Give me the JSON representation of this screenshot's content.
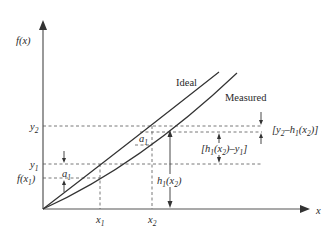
{
  "diagram": {
    "y_axis_label": "f(x)",
    "x_axis_label": "x",
    "curves": [
      {
        "name": "Ideal",
        "label": "Ideal"
      },
      {
        "name": "Measured",
        "label": "Measured"
      }
    ],
    "y_ticks": {
      "y2": {
        "base": "y",
        "sub": "2"
      },
      "y1": {
        "base": "y",
        "sub": "1"
      },
      "fx1": {
        "pre": "f(x",
        "sub": "1",
        "post": ")"
      }
    },
    "x_ticks": {
      "x1": {
        "base": "x",
        "sub": "1"
      },
      "x2": {
        "base": "x",
        "sub": "2"
      }
    },
    "annotations": {
      "a1_left": {
        "base": "a",
        "sub": "1"
      },
      "a1_mid": {
        "base": "a",
        "sub": "1"
      },
      "h1x2": {
        "a": "h",
        "asub": "1",
        "b": "(x",
        "bsub": "2",
        "c": ")"
      },
      "bracket_top": {
        "open": "[",
        "y": "y",
        "ysub": "2",
        "dash": "–",
        "h": "h",
        "hsub": "1",
        "x": "(x",
        "xsub": "2",
        "close": ")]"
      },
      "bracket_mid": {
        "open": "[",
        "h": "h",
        "hsub": "1",
        "x": "(x",
        "xsub": "2",
        "mid": ")–",
        "y": "y",
        "ysub": "1",
        "close": "]"
      }
    }
  }
}
